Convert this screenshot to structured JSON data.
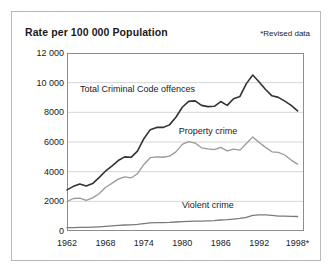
{
  "figure": {
    "title": "Rate per 100 000 Population",
    "note": "*Revised data"
  },
  "chart_data": {
    "type": "line",
    "title": "Rate per 100 000 Population",
    "xlabel": "",
    "ylabel": "Rate per 100 000 Population",
    "annotations": [
      "*Revised data"
    ],
    "grid": true,
    "legend_position": "inline-labels",
    "xlim": [
      1962,
      1999
    ],
    "ylim": [
      0,
      12000
    ],
    "ytick_labels": [
      "12 000",
      "10 000",
      "8000",
      "6000",
      "4000",
      "2000",
      "0"
    ],
    "ytick_values": [
      12000,
      10000,
      8000,
      6000,
      4000,
      2000,
      0
    ],
    "xtick_labels": [
      "1962",
      "1968",
      "1974",
      "1980",
      "1986",
      "1992",
      "1998*"
    ],
    "xtick_values": [
      1962,
      1968,
      1974,
      1980,
      1986,
      1992,
      1998
    ],
    "x": [
      1962,
      1963,
      1964,
      1965,
      1966,
      1967,
      1968,
      1969,
      1970,
      1971,
      1972,
      1973,
      1974,
      1975,
      1976,
      1977,
      1978,
      1979,
      1980,
      1981,
      1982,
      1983,
      1984,
      1985,
      1986,
      1987,
      1988,
      1989,
      1990,
      1991,
      1992,
      1993,
      1994,
      1995,
      1996,
      1997,
      1998
    ],
    "series": [
      {
        "name": "Total Criminal Code offences",
        "color": "#333333",
        "label_x": 1973,
        "label_y": 9500,
        "values": [
          2771,
          3009,
          3162,
          3034,
          3197,
          3597,
          4032,
          4374,
          4750,
          4994,
          4968,
          5380,
          6222,
          6833,
          6985,
          6983,
          7154,
          7666,
          8343,
          8736,
          8773,
          8470,
          8387,
          8409,
          8728,
          8472,
          8917,
          9073,
          9935,
          10512,
          10040,
          9538,
          9113,
          9008,
          8759,
          8472,
          8094
        ],
        "style": "dark"
      },
      {
        "name": "Property crime",
        "color": "#9a9a9a",
        "label_x": 1984,
        "label_y": 6700,
        "values": [
          1991,
          2192,
          2218,
          2060,
          2232,
          2510,
          2937,
          3208,
          3497,
          3652,
          3576,
          3863,
          4488,
          4941,
          5000,
          4972,
          5045,
          5336,
          5836,
          6029,
          5930,
          5607,
          5531,
          5482,
          5636,
          5398,
          5516,
          5452,
          5899,
          6344,
          5971,
          5637,
          5337,
          5296,
          5124,
          4781,
          4510
        ],
        "style": "light"
      },
      {
        "name": "Violent crime",
        "color": "#7a7a7a",
        "label_x": 1984,
        "label_y": 1700,
        "values": [
          221,
          233,
          244,
          245,
          261,
          283,
          311,
          346,
          378,
          403,
          414,
          452,
          502,
          548,
          562,
          570,
          582,
          608,
          636,
          654,
          670,
          672,
          682,
          701,
          740,
          767,
          806,
          846,
          913,
          1059,
          1084,
          1082,
          1047,
          1008,
          1002,
          985,
          978
        ],
        "style": "mid"
      }
    ]
  }
}
